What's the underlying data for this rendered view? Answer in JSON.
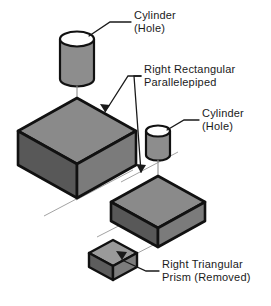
{
  "figure": {
    "background_color": "#ffffff",
    "outline_color": "#1a1a1a"
  },
  "palette": {
    "top_face": "#8a8a8a",
    "left_face": "#585858",
    "right_face": "#7b7b7b",
    "cylinder_body": "#8d8d8d",
    "cylinder_top": "#ffffff",
    "prism_top": "#9a9a9a",
    "prism_left": "#5d5d5d",
    "prism_right": "#7d7d7d",
    "outline": "#111111",
    "thin_line": "#9a9a9a",
    "leader": "#1a1a1a",
    "text": "#1a1a1a"
  },
  "labels": {
    "cylinder_top": {
      "line1": "Cylinder",
      "line2": "(Hole)"
    },
    "parallelepiped": {
      "line1": "Right  Rectangular",
      "line2": "Parallelepiped"
    },
    "cylinder_right": {
      "line1": "Cylinder",
      "line2": "(Hole)"
    },
    "prism": {
      "line1": "Right  Triangular",
      "line2": "Prism  (Removed)"
    }
  },
  "shapes": {
    "cylinder_upper": {
      "name": "Cylinder (Hole)",
      "role": "hole-tool"
    },
    "block_large": {
      "name": "Right Rectangular Parallelepiped",
      "role": "base-solid"
    },
    "cylinder_lower": {
      "name": "Cylinder (Hole)",
      "role": "hole-tool"
    },
    "block_small": {
      "name": "Right Rectangular Parallelepiped",
      "role": "base-solid"
    },
    "prism_small": {
      "name": "Right Triangular Prism (Removed)",
      "role": "removed-solid"
    }
  }
}
